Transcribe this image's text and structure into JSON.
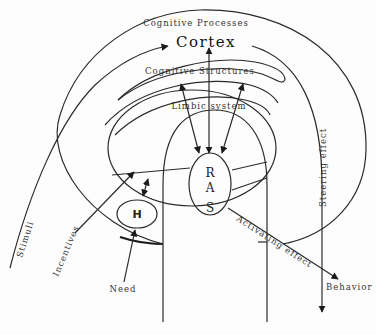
{
  "diagram": {
    "title": "Cortex",
    "layers": {
      "outer": "Cognitive Processes",
      "cortex": "Cortex",
      "structures": "Cognitive Structures",
      "limbic": "Limbic system"
    },
    "nodes": {
      "ras": [
        "R",
        "A",
        "S"
      ],
      "h": "H"
    },
    "labels": {
      "stimuli": "Stimuli",
      "incentives": "Incentives",
      "need": "Need",
      "steering": "Steering effect",
      "activating": "Activating effect",
      "behavior": "Behavior"
    },
    "colors": {
      "line": "#2a2a2a",
      "background": "#fdfdfd"
    }
  }
}
